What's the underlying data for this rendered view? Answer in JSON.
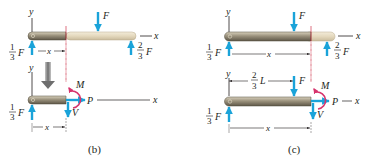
{
  "figure": {
    "panels": [
      {
        "id": "b",
        "caption": "(b)",
        "top": {
          "axis_y": "y",
          "axis_x": "x",
          "load": "F",
          "left_reaction": {
            "num": "1",
            "den": "3",
            "sym": "F"
          },
          "right_reaction": {
            "num": "2",
            "den": "3",
            "sym": "F"
          },
          "dimension": "x"
        },
        "bottom": {
          "axis_y": "y",
          "axis_x": "x",
          "left_reaction": {
            "num": "1",
            "den": "3",
            "sym": "F"
          },
          "moment": "M",
          "normal": "P",
          "shear": "V",
          "dimension": "x"
        }
      },
      {
        "id": "c",
        "caption": "(c)",
        "top": {
          "axis_y": "y",
          "axis_x": "x",
          "load": "F",
          "left_reaction": {
            "num": "1",
            "den": "3",
            "sym": "F"
          },
          "right_reaction": {
            "num": "2",
            "den": "3",
            "sym": "F"
          },
          "dimension": "x"
        },
        "bottom": {
          "axis_y": "y",
          "axis_x": "x",
          "load": "F",
          "load_position": {
            "num": "2",
            "den": "3",
            "sym": "L"
          },
          "left_reaction": {
            "num": "1",
            "den": "3",
            "sym": "F"
          },
          "moment": "M",
          "normal": "P",
          "shear": "V",
          "dimension": "x"
        }
      }
    ],
    "colors": {
      "arrow": "#1aa3d9",
      "moment": "#d6336c",
      "cut": "#c8102e",
      "beam_dark": "#8a8270",
      "beam_light": "#e6dcc4",
      "text": "#231f20"
    }
  }
}
